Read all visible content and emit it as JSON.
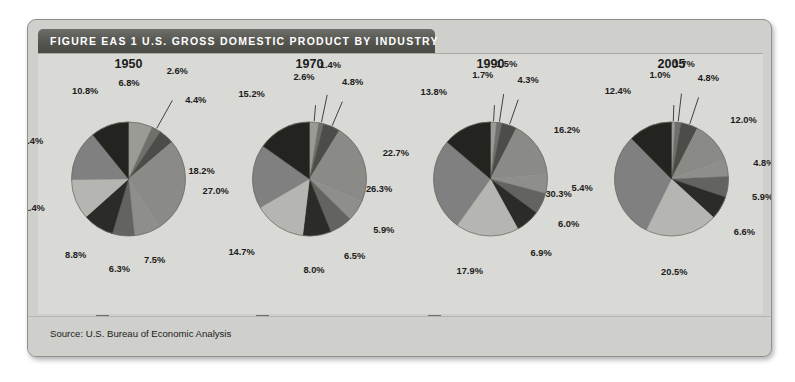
{
  "figure": {
    "title": "FIGURE EAS 1  U.S. GROSS DOMESTIC PRODUCT BY INDUSTRY",
    "source": "Source: U.S. Bureau of Economic Analysis"
  },
  "legend": {
    "columns": [
      {
        "items": [
          {
            "label": "Agriculture, forestry, and fishing",
            "color": "#9a9a96"
          },
          {
            "label": "Mining",
            "color": "#6f6f6b"
          },
          {
            "label": "Construction",
            "color": "#4c4c48"
          },
          {
            "label": "Manufacturing",
            "color": "#8a8a86"
          }
        ]
      },
      {
        "items": [
          {
            "label": "Transportation and public utilities",
            "color": "#8e8e8a"
          },
          {
            "label": "Wholesale trade",
            "color": "#63635f"
          },
          {
            "label": "Retail trade",
            "color": "#2b2b28"
          },
          {
            "label": "Finance, insurance, and real estate",
            "color": "#b5b5b1"
          }
        ]
      },
      {
        "items": [
          {
            "label": "Services",
            "color": "#808080"
          },
          {
            "label": "Government",
            "color": "#23231f"
          }
        ]
      }
    ]
  },
  "chart_data": {
    "type": "pie",
    "title": "U.S. Gross Domestic Product by Industry",
    "unit": "percent",
    "legend_position": "bottom",
    "categories": [
      "Agriculture, forestry, and fishing",
      "Mining",
      "Construction",
      "Manufacturing",
      "Transportation and public utilities",
      "Wholesale trade",
      "Retail trade",
      "Finance, insurance, and real estate",
      "Services",
      "Government"
    ],
    "colors": [
      "#9a9a96",
      "#6f6f6b",
      "#4c4c48",
      "#8a8a86",
      "#8e8e8a",
      "#63635f",
      "#2b2b28",
      "#b5b5b1",
      "#808080",
      "#23231f"
    ],
    "pies": [
      {
        "year": "1950",
        "values": [
          6.8,
          2.6,
          4.4,
          27.0,
          7.5,
          6.3,
          8.8,
          11.4,
          14.4,
          10.8
        ],
        "labels": [
          "6.8%",
          "2.6%",
          "4.4%",
          "27.0%",
          "7.5%",
          "6.3%",
          "8.8%",
          "11.4%",
          "14.4%",
          "10.8%"
        ]
      },
      {
        "year": "1970",
        "values": [
          2.6,
          1.4,
          4.8,
          22.7,
          5.9,
          6.5,
          8.0,
          14.7,
          18.2,
          15.2
        ],
        "labels": [
          "2.6%",
          "1.4%",
          "4.8%",
          "22.7%",
          "5.9%",
          "6.5%",
          "8.0%",
          "14.7%",
          "18.2%",
          "15.2%"
        ]
      },
      {
        "year": "1990",
        "values": [
          1.7,
          1.5,
          4.3,
          16.2,
          5.4,
          6.0,
          6.9,
          17.9,
          26.3,
          13.8
        ],
        "labels": [
          "1.7%",
          "1.5%",
          "4.3%",
          "16.2%",
          "5.4%",
          "6.0%",
          "6.9%",
          "17.9%",
          "26.3%",
          "13.8%"
        ]
      },
      {
        "year": "2005",
        "values": [
          1.0,
          1.7,
          4.8,
          12.0,
          4.8,
          5.9,
          6.6,
          20.5,
          30.3,
          12.4
        ],
        "labels": [
          "1.0%",
          "1.7%",
          "4.8%",
          "12.0%",
          "4.8%",
          "5.9%",
          "6.6%",
          "20.5%",
          "30.3%",
          "12.4%"
        ]
      }
    ]
  }
}
